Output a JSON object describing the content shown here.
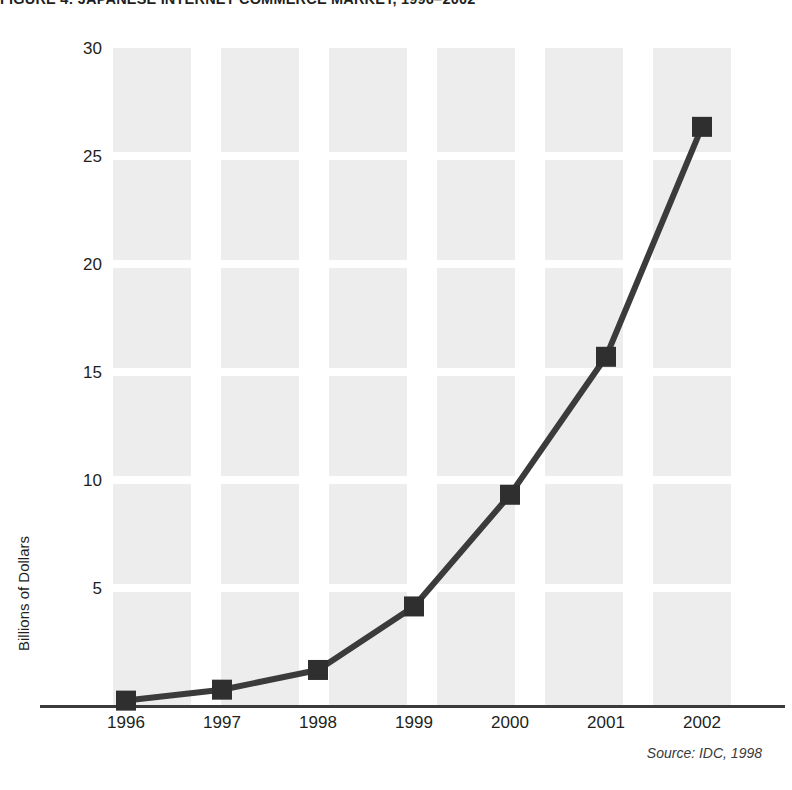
{
  "title": "FIGURE 4: JAPANESE INTERNET COMMERCE MARKET, 1996–2002",
  "source_note": "Source: IDC, 1998",
  "y_axis_title": "Billions of Dollars",
  "colors": {
    "line": "#3b3b3b",
    "marker": "#2f2f2f",
    "band": "#ededed",
    "axis": "#3b3b3b",
    "text": "#231f20"
  },
  "chart_data": {
    "type": "line",
    "title": "FIGURE 4: JAPANESE INTERNET COMMERCE MARKET, 1996–2002",
    "xlabel": "",
    "ylabel": "Billions of Dollars",
    "categories": [
      "1996",
      "1997",
      "1998",
      "1999",
      "2000",
      "2001",
      "2002"
    ],
    "values": [
      0.2,
      0.7,
      1.6,
      4.5,
      9.6,
      15.9,
      26.4
    ],
    "ylim": [
      0,
      30
    ],
    "yticks": [
      5,
      10,
      15,
      20,
      25,
      30
    ],
    "ytick_labels": [
      "5",
      "10",
      "15",
      "20",
      "25",
      "30"
    ],
    "grid": "horizontal-gaps-over-vertical-bands",
    "legend": "none",
    "marker": "square",
    "source": "IDC, 1998"
  }
}
